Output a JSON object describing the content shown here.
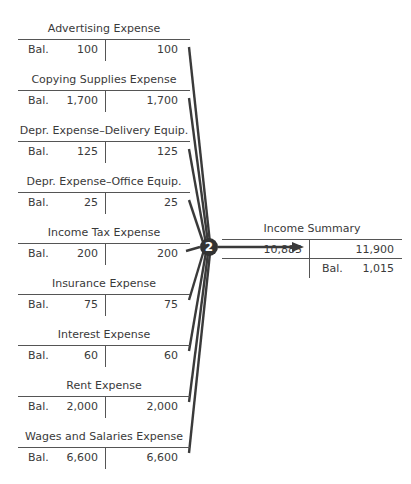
{
  "accounts": [
    {
      "title": "Advertising Expense",
      "bal_label": "Bal.",
      "debit": "100",
      "credit": "100",
      "top": 22
    },
    {
      "title": "Copying Supplies Expense",
      "bal_label": "Bal.",
      "debit": "1,700",
      "credit": "1,700",
      "top": 73
    },
    {
      "title": "Depr. Expense–Delivery Equip.",
      "bal_label": "Bal.",
      "debit": "125",
      "credit": "125",
      "top": 124
    },
    {
      "title": "Depr. Expense–Office Equip.",
      "bal_label": "Bal.",
      "debit": "25",
      "credit": "25",
      "top": 175
    },
    {
      "title": "Income Tax Expense",
      "bal_label": "Bal.",
      "debit": "200",
      "credit": "200",
      "top": 226
    },
    {
      "title": "Insurance Expense",
      "bal_label": "Bal.",
      "debit": "75",
      "credit": "75",
      "top": 277
    },
    {
      "title": "Interest Expense",
      "bal_label": "Bal.",
      "debit": "60",
      "credit": "60",
      "top": 328
    },
    {
      "title": "Rent Expense",
      "bal_label": "Bal.",
      "debit": "2,000",
      "credit": "2,000",
      "top": 379
    },
    {
      "title": "Wages and Salaries Expense",
      "bal_label": "Bal.",
      "debit": "6,600",
      "credit": "6,600",
      "top": 430
    }
  ],
  "income_summary": {
    "title": "Income Summary",
    "debit": "10,885",
    "credit": "11,900",
    "bal_label": "Bal.",
    "balance": "1,015"
  },
  "step_badge": "2"
}
